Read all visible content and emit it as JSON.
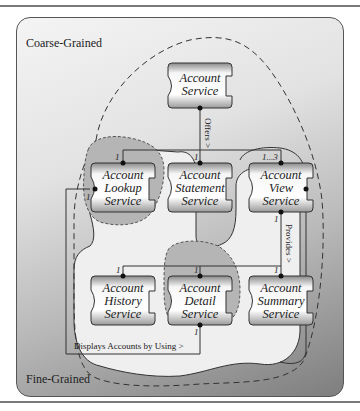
{
  "regions": {
    "coarse_label": "Coarse-Grained",
    "fine_label": "Fine-Grained"
  },
  "services": {
    "account": {
      "line1": "Account",
      "line2": "Service"
    },
    "lookup": {
      "line1": "Account",
      "line2": "Lookup",
      "line3": "Service"
    },
    "statement": {
      "line1": "Account",
      "line2": "Statement",
      "line3": "Service"
    },
    "view": {
      "line1": "Account",
      "line2": "View",
      "line3": "Service"
    },
    "history": {
      "line1": "Account",
      "line2": "History",
      "line3": "Service"
    },
    "detail": {
      "line1": "Account",
      "line2": "Detail",
      "line3": "Service"
    },
    "summary": {
      "line1": "Account",
      "line2": "Summary",
      "line3": "Service"
    }
  },
  "relationships": {
    "offers": "Offers >",
    "provides": "Provides >",
    "displays": "Displays Accounts by Using >"
  },
  "multiplicities": {
    "lookup_top": "1",
    "statement_top": "1",
    "view_top": "1...3",
    "view_bottom": "1",
    "lookup_left": "1",
    "history_top": "1",
    "detail_top": "1",
    "summary_top": "1",
    "detail_bottom": "1"
  },
  "colors": {
    "frame_light": "#f4f4f4",
    "frame_dark": "#7e7e7e",
    "highlight_region": "#b5b5b5",
    "fine_region": "#efefef",
    "line": "#333333"
  }
}
